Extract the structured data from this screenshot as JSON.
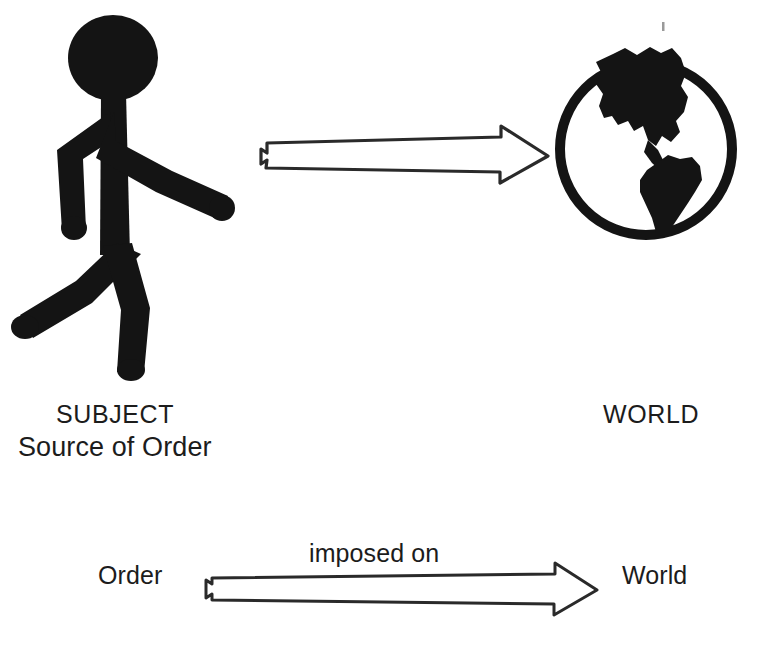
{
  "diagram": {
    "background_color": "#ffffff",
    "ink_color": "#1c1c1c",
    "figures": [
      {
        "name": "stick-figure-person",
        "icon": "walking-person-icon",
        "meaning": "subject"
      },
      {
        "name": "globe",
        "icon": "globe-americas-icon",
        "meaning": "world"
      }
    ],
    "top_row": {
      "left_label_primary": "SUBJECT",
      "left_label_secondary": "Source of Order",
      "right_label": "WORLD",
      "arrow": {
        "name": "hollow-block-arrow",
        "direction": "right",
        "from": "SUBJECT",
        "to": "WORLD"
      }
    },
    "bottom_row": {
      "source_term": "Order",
      "relation_label": "imposed on",
      "target_term": "World",
      "arrow": {
        "name": "hollow-block-arrow",
        "direction": "right",
        "from": "Order",
        "to": "World"
      }
    }
  }
}
